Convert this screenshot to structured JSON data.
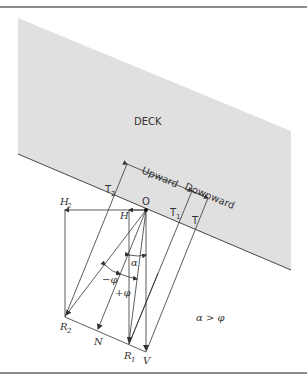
{
  "diagram": {
    "deck_label": "DECK",
    "direction_labels": {
      "upward": "Upward",
      "downward": "Downward"
    },
    "points": {
      "O": "O",
      "T": "T",
      "T1": "T",
      "T1_sub": "1",
      "T2": "T",
      "T2_sub": "2",
      "H": "H",
      "H2": "H",
      "H2_sub": "2",
      "R1": "R",
      "R1_sub": "1",
      "R2": "R",
      "R2_sub": "2",
      "N": "N",
      "V": "V"
    },
    "angles": {
      "alpha": "α",
      "minus_phi": "−φ",
      "plus_phi": "+φ"
    },
    "condition": "α > φ",
    "colors": {
      "deck_fill": "#e0e0e0",
      "line": "#333333",
      "rule": "#8a8a8a"
    }
  }
}
